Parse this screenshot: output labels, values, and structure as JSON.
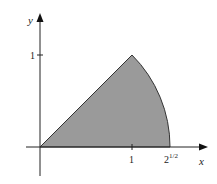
{
  "figure": {
    "axes": {
      "x_label": "x",
      "y_label": "y",
      "x_ticks": [
        {
          "value": 1,
          "label": "1"
        },
        {
          "value": 1.41421,
          "label_base": "2",
          "label_exp": "1/2"
        }
      ],
      "y_ticks": [
        {
          "value": 1,
          "label": "1"
        }
      ]
    },
    "region": {
      "vertices": [
        [
          0,
          0
        ],
        [
          1,
          1
        ],
        [
          1.41421,
          0
        ]
      ],
      "boundary": [
        "line y = x from (0,0) to (1,1)",
        "arc of circle radius 2^(1/2) from (1,1) to (2^(1/2),0)",
        "x-axis from (2^(1/2),0) to (0,0)"
      ],
      "fill_color": "#9a9a9a",
      "stroke_color": "#333333"
    }
  }
}
